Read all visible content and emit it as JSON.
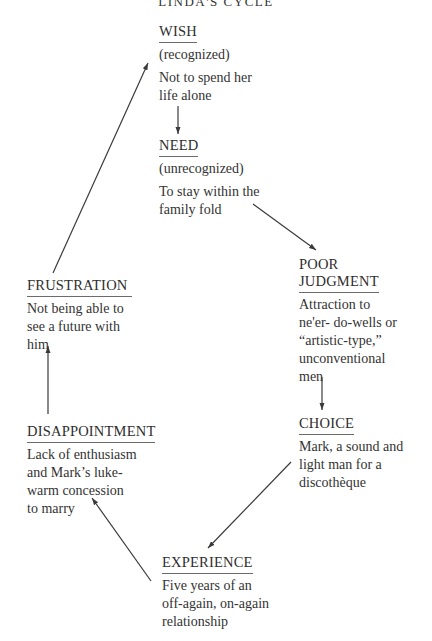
{
  "title": "LINDA'S CYCLE",
  "nodes": {
    "wish": {
      "heading": "WISH",
      "qualifier": "(recognized)",
      "text": [
        "Not to spend her",
        "life alone"
      ]
    },
    "need": {
      "heading": "NEED",
      "qualifier": "(unrecognized)",
      "text": [
        "To stay within the",
        "family fold"
      ]
    },
    "poor_judgment": {
      "heading": [
        "POOR",
        "JUDGMENT"
      ],
      "text": [
        "Attraction to",
        "ne'er- do-wells or",
        "“artistic-type,”",
        "unconventional",
        "men"
      ]
    },
    "choice": {
      "heading": "CHOICE",
      "text": [
        "Mark, a sound and",
        "light man for a",
        "discothèque"
      ]
    },
    "experience": {
      "heading": "EXPERIENCE",
      "text": [
        "Five years of an",
        "off-again, on-again",
        "relationship"
      ]
    },
    "disappointment": {
      "heading": "DISAPPOINTMENT",
      "text": [
        "Lack of enthusiasm",
        "and Mark’s luke-",
        "warm concession",
        "to marry"
      ]
    },
    "frustration": {
      "heading": "FRUSTRATION",
      "text": [
        "Not being able to",
        "see a future with",
        "him"
      ]
    }
  },
  "edges": [
    {
      "from": "wish",
      "to": "need"
    },
    {
      "from": "need",
      "to": "poor_judgment"
    },
    {
      "from": "poor_judgment",
      "to": "choice"
    },
    {
      "from": "choice",
      "to": "experience"
    },
    {
      "from": "experience",
      "to": "disappointment"
    },
    {
      "from": "disappointment",
      "to": "frustration"
    },
    {
      "from": "frustration",
      "to": "wish"
    }
  ],
  "colors": {
    "text": "#2b2b2b",
    "line": "#3a3a3a",
    "background": "#ffffff"
  }
}
